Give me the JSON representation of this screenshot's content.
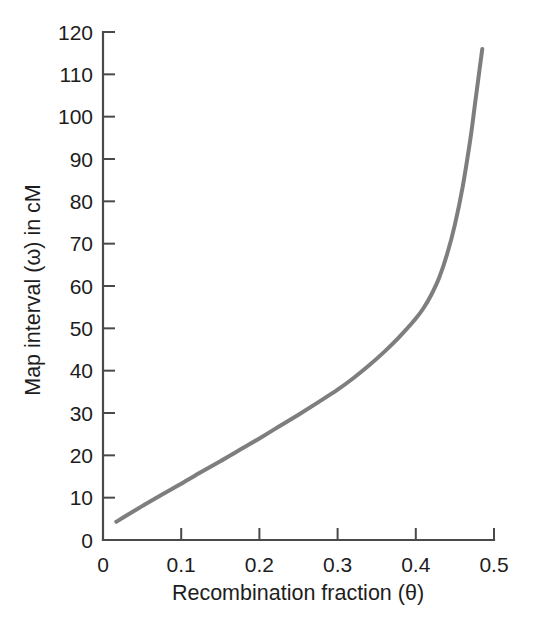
{
  "figure": {
    "background_color": "#ffffff",
    "axis_color": "#4a4a4a",
    "text_color": "#1d1d1d"
  },
  "chart_data": {
    "type": "line",
    "title": "",
    "subtitle": "",
    "xlabel": "Recombination fraction (θ)",
    "ylabel": "Map interval (ω) in cM",
    "xlim": [
      0,
      0.5
    ],
    "ylim": [
      0,
      120
    ],
    "xticks": [
      0,
      0.1,
      0.2,
      0.3,
      0.4,
      0.5
    ],
    "xtick_labels": [
      "0",
      "0.1",
      "0.2",
      "0.3",
      "0.4",
      "0.5"
    ],
    "yticks": [
      0,
      10,
      20,
      30,
      40,
      50,
      60,
      70,
      80,
      90,
      100,
      110,
      120
    ],
    "ytick_labels": [
      "0",
      "10",
      "20",
      "30",
      "40",
      "50",
      "60",
      "70",
      "80",
      "90",
      "100",
      "110",
      "120"
    ],
    "grid": false,
    "legend": null,
    "legend_position": "none",
    "series": [
      {
        "name": "Map interval",
        "color": "#7e7e7e",
        "line_width": 4,
        "x": [
          0.017,
          0.03,
          0.05,
          0.075,
          0.1,
          0.125,
          0.15,
          0.175,
          0.2,
          0.225,
          0.25,
          0.275,
          0.3,
          0.32,
          0.34,
          0.36,
          0.375,
          0.39,
          0.4,
          0.41,
          0.42,
          0.43,
          0.44,
          0.45,
          0.46,
          0.47,
          0.475,
          0.48,
          0.485
        ],
        "y": [
          4.3,
          5.8,
          8.0,
          10.7,
          13.3,
          16.0,
          18.6,
          21.3,
          24.0,
          26.8,
          29.6,
          32.5,
          35.5,
          38.2,
          41.2,
          44.5,
          47.2,
          50.2,
          52.3,
          54.8,
          58.0,
          62.0,
          67.5,
          74.5,
          83.5,
          95.0,
          102.0,
          109.0,
          116.0
        ]
      }
    ],
    "annotations": []
  }
}
